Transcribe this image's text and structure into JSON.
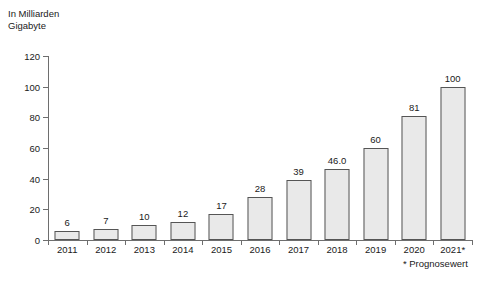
{
  "unit_caption": "In Milliarden\nGigabyte",
  "footnote": "* Prognosewert",
  "colors": {
    "bar_fill": "#e9e9e9",
    "bar_stroke": "#555555",
    "axis": "#6e6e6e",
    "text": "#1a1a1a",
    "background": "#ffffff"
  },
  "chart_data": {
    "type": "bar",
    "title": "",
    "subtitle": "",
    "xlabel": "",
    "ylabel": "In Milliarden Gigabyte",
    "ylim": [
      0,
      120
    ],
    "yticks": [
      0,
      20,
      40,
      60,
      80,
      100,
      120
    ],
    "ytick_labels": [
      "0",
      "20",
      "40",
      "60",
      "80",
      "100",
      "120"
    ],
    "grid": false,
    "legend": null,
    "categories": [
      "2011",
      "2012",
      "2013",
      "2014",
      "2015",
      "2016",
      "2017",
      "2018",
      "2019",
      "2020",
      "2021*"
    ],
    "values": [
      6,
      7,
      10,
      12,
      17,
      28,
      39,
      46.0,
      60,
      81,
      100
    ],
    "data_labels": [
      "6",
      "7",
      "10",
      "12",
      "17",
      "28",
      "39",
      "46.0",
      "60",
      "81",
      "100"
    ],
    "annotations": [
      "* Prognosewert"
    ]
  }
}
